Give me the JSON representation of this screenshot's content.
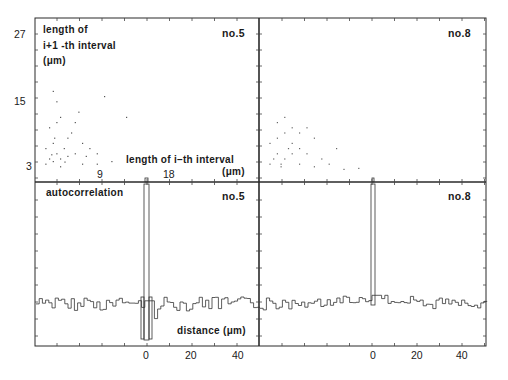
{
  "figure": {
    "panels": {
      "scatter_no5": {
        "tag": "no.5",
        "ylabel_line1": "length of",
        "ylabel_line2": "i+1 -th interval",
        "ylabel_line3": "(μm)",
        "xlabel_line1": "length of  i–th  interval",
        "xlabel_line2": "(μm)"
      },
      "scatter_no8": {
        "tag": "no.8"
      },
      "autocorr_no5": {
        "tag": "no.5",
        "title": "autocorrelation",
        "xlabel": "distance (μm)"
      },
      "autocorr_no8": {
        "tag": "no.8"
      }
    },
    "y_ticks": [
      "27",
      "15",
      "3"
    ],
    "x_ticks_scatter": [
      "9",
      "18"
    ],
    "x_ticks_autocorr_left": [
      "0",
      "20",
      "40"
    ],
    "x_ticks_autocorr_right": [
      "0",
      "20",
      "40"
    ]
  },
  "chart_data": [
    {
      "type": "scatter",
      "title": "no.5",
      "xlabel": "length of i-th interval (μm)",
      "ylabel": "length of i+1-th interval (μm)",
      "xlim": [
        0,
        30
      ],
      "ylim": [
        0,
        30
      ],
      "x_ticks": [
        9,
        18
      ],
      "y_ticks": [
        3,
        15,
        27
      ],
      "points": [
        [
          1,
          2
        ],
        [
          1.5,
          3
        ],
        [
          2,
          2.5
        ],
        [
          2.5,
          4
        ],
        [
          3,
          3
        ],
        [
          1,
          5
        ],
        [
          2,
          6
        ],
        [
          3.5,
          5
        ],
        [
          4,
          7
        ],
        [
          4.5,
          8
        ],
        [
          1.5,
          9
        ],
        [
          2.5,
          10
        ],
        [
          3,
          11
        ],
        [
          5,
          10
        ],
        [
          5.5,
          12
        ],
        [
          6,
          6
        ],
        [
          7,
          5
        ],
        [
          8,
          4
        ],
        [
          2,
          16
        ],
        [
          2.5,
          14
        ],
        [
          9,
          15
        ],
        [
          12,
          11
        ],
        [
          4,
          3.5
        ],
        [
          6,
          2
        ],
        [
          8,
          2
        ],
        [
          10,
          2.5
        ],
        [
          3,
          1.5
        ],
        [
          1.8,
          3.8
        ],
        [
          2.2,
          7
        ],
        [
          3.6,
          2.4
        ],
        [
          5,
          4
        ],
        [
          6.5,
          3.5
        ]
      ]
    },
    {
      "type": "scatter",
      "title": "no.8",
      "xlim": [
        0,
        30
      ],
      "ylim": [
        0,
        30
      ],
      "points": [
        [
          1,
          2
        ],
        [
          1.5,
          3
        ],
        [
          2,
          4
        ],
        [
          2.5,
          2
        ],
        [
          3,
          3
        ],
        [
          3.5,
          5
        ],
        [
          4,
          4
        ],
        [
          1,
          6
        ],
        [
          2,
          7
        ],
        [
          3,
          8
        ],
        [
          4,
          6
        ],
        [
          5,
          5
        ],
        [
          6,
          4
        ],
        [
          7,
          7
        ],
        [
          8,
          3
        ],
        [
          9,
          2
        ],
        [
          10,
          5
        ],
        [
          2,
          10
        ],
        [
          3,
          11
        ],
        [
          4,
          9
        ],
        [
          5,
          8
        ],
        [
          6,
          9
        ],
        [
          2.5,
          1.5
        ],
        [
          5,
          2
        ],
        [
          7,
          1.5
        ],
        [
          11,
          1
        ],
        [
          13,
          1.2
        ]
      ]
    },
    {
      "type": "line",
      "title": "autocorrelation no.5",
      "xlabel": "distance (μm)",
      "x_ticks": [
        0,
        20,
        40
      ],
      "xlim": [
        -50,
        50
      ],
      "note": "sharp peak at distance 0 reaching top of panel; noisy baseline elsewhere with negative side-lobes adjacent to 0",
      "x": [
        -50,
        -46,
        -42,
        -38,
        -34,
        -30,
        -26,
        -22,
        -18,
        -14,
        -10,
        -6,
        -2,
        0,
        2,
        6,
        10,
        14,
        18,
        22,
        26,
        30,
        34,
        38,
        42,
        46,
        50
      ],
      "values": [
        0.05,
        0.12,
        -0.05,
        0.1,
        0.0,
        0.08,
        -0.02,
        0.11,
        0.0,
        0.04,
        -0.04,
        0.03,
        0.2,
        1.0,
        -0.35,
        0.02,
        0.0,
        0.06,
        0.1,
        -0.02,
        0.08,
        0.12,
        0.0,
        0.1,
        -0.05,
        0.12,
        0.06
      ]
    },
    {
      "type": "line",
      "title": "autocorrelation no.8",
      "x_ticks": [
        0,
        20,
        40
      ],
      "xlim": [
        -50,
        50
      ],
      "note": "sharp peak at distance 0; smooth broad hump near zero decaying outward",
      "x": [
        -50,
        -46,
        -42,
        -38,
        -34,
        -30,
        -26,
        -22,
        -18,
        -14,
        -10,
        -6,
        -2,
        0,
        2,
        6,
        10,
        14,
        18,
        22,
        26,
        30,
        34,
        38,
        42,
        46,
        50
      ],
      "values": [
        0.1,
        0.02,
        0.06,
        0.05,
        0.08,
        0.06,
        0.09,
        0.1,
        0.12,
        0.14,
        0.16,
        0.17,
        0.18,
        1.0,
        0.17,
        0.16,
        0.14,
        0.12,
        0.1,
        0.08,
        0.06,
        0.05,
        0.04,
        0.03,
        0.05,
        0.08,
        0.02
      ]
    }
  ]
}
